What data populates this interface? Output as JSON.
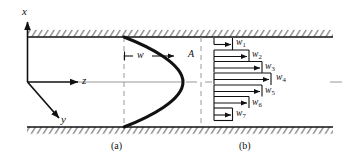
{
  "figure": {
    "type": "technical-diagram",
    "background_color": "#ffffff",
    "line_color": "#111111",
    "hatch_color": "#555555",
    "dash_color": "#999999"
  },
  "axes": {
    "x_label": "x",
    "y_label": "y",
    "z_label": "z",
    "origin": {
      "x": 27,
      "y": 82
    }
  },
  "panel_a": {
    "caption": "(a)",
    "velocity_label": "w",
    "section_label": "A",
    "description": "Parabolic velocity profile between two hatched walls"
  },
  "panel_b": {
    "caption": "(b)",
    "description": "Seven discrete velocity arrows approximating the profile",
    "arrows": [
      {
        "label": "w",
        "sub": "1",
        "length": 16
      },
      {
        "label": "w",
        "sub": "2",
        "length": 38
      },
      {
        "label": "w",
        "sub": "3",
        "length": 48
      },
      {
        "label": "w",
        "sub": "4",
        "length": 57
      },
      {
        "label": "w",
        "sub": "5",
        "length": 48
      },
      {
        "label": "w",
        "sub": "6",
        "length": 38
      },
      {
        "label": "w",
        "sub": "7",
        "length": 16
      }
    ]
  },
  "walls": {
    "top_y": 37,
    "bottom_y": 127,
    "left_x": 27,
    "right_x": 333
  }
}
